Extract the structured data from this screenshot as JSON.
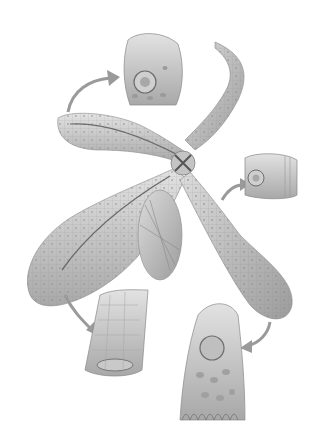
{
  "image": {
    "description": "Grayscale scientific illustration of a branching gland/duct system with four lobes, each with an arrow pointing to a magnified epithelial cell block",
    "colors": {
      "background": "#ffffff",
      "tissue_light": "#d9d9d9",
      "tissue_mid": "#b5b5b5",
      "tissue_dark": "#7a7a7a",
      "arrow": "#9a9a9a"
    },
    "elements": [
      {
        "name": "upper-left-lobe"
      },
      {
        "name": "lower-left-lobe"
      },
      {
        "name": "lower-right-lobe"
      },
      {
        "name": "upper-right-duct"
      },
      {
        "name": "central-junction"
      },
      {
        "name": "cell-block-top"
      },
      {
        "name": "cell-block-right"
      },
      {
        "name": "cell-block-bottom-left"
      },
      {
        "name": "cell-block-bottom-right"
      }
    ]
  }
}
